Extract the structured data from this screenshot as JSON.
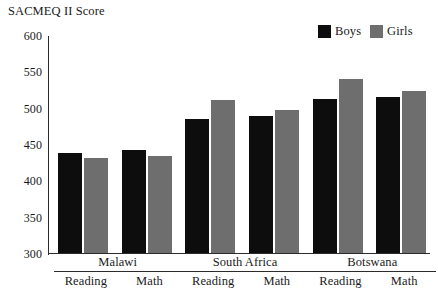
{
  "figure": {
    "clipped_top_text": "",
    "y_axis_title": "SACMEQ II Score"
  },
  "legend": {
    "entries": [
      {
        "label": "Boys",
        "color": "#0d0d0d"
      },
      {
        "label": "Girls",
        "color": "#6e6e6e"
      }
    ]
  },
  "axis": {
    "ticks": [
      "600",
      "550",
      "500",
      "450",
      "400",
      "350",
      "300"
    ]
  },
  "groups": [
    {
      "name": "Malawi",
      "subs": [
        "Reading",
        "Math"
      ]
    },
    {
      "name": "South Africa",
      "subs": [
        "Reading",
        "Math"
      ]
    },
    {
      "name": "Botswana",
      "subs": [
        "Reading",
        "Math"
      ]
    }
  ],
  "chart_data": {
    "type": "bar",
    "title": "",
    "xlabel": "",
    "ylabel": "SACMEQ II Score",
    "ylim": [
      300,
      600
    ],
    "ytick_step": 50,
    "grid": false,
    "legend_position": "top-right",
    "categories": [
      "Malawi Reading",
      "Malawi Math",
      "South Africa Reading",
      "South Africa Math",
      "Botswana Reading",
      "Botswana Math"
    ],
    "series": [
      {
        "name": "Boys",
        "color": "#0d0d0d",
        "values": [
          438,
          442,
          484,
          488,
          512,
          515
        ]
      },
      {
        "name": "Girls",
        "color": "#6e6e6e",
        "values": [
          431,
          433,
          510,
          497,
          540,
          523
        ]
      }
    ]
  }
}
